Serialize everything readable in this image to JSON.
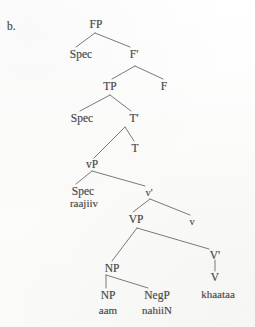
{
  "figure": {
    "enumerator": "b.",
    "language_example": "raajiiv aam nahiiN khaataa"
  },
  "tree": {
    "nodes": {
      "fp": "FP",
      "spec_fp": "Spec",
      "f_bar": "F'",
      "tp": "TP",
      "f": "F",
      "spec_tp": "Spec",
      "t_bar": "T'",
      "t": "T",
      "vp_small": "vP",
      "spec_vp": "Spec",
      "spec_vp_word": "raajiiv",
      "v_bar_small": "v'",
      "vp_big": "VP",
      "v_small": "v",
      "np_upper": "NP",
      "v_bar_big": "V'",
      "np_lower": "NP",
      "np_lower_word": "aam",
      "negp": "NegP",
      "negp_word": "nahiiN",
      "v_big": "V",
      "v_big_word": "khaataa"
    }
  },
  "style": {
    "line_color": "#6b6b6b",
    "text_color": "#4b4b4b",
    "background": "#fdfdfc"
  }
}
